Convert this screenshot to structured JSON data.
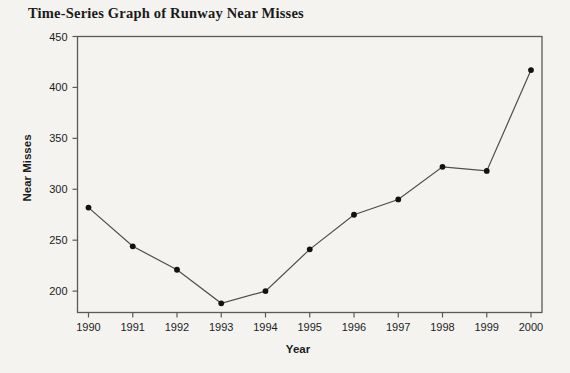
{
  "page": {
    "background": "#f4f3f0"
  },
  "chart_data": {
    "type": "line",
    "title": "Time-Series Graph of Runway Near Misses",
    "xlabel": "Year",
    "ylabel": "Near Misses",
    "x": [
      1990,
      1991,
      1992,
      1993,
      1994,
      1995,
      1996,
      1997,
      1998,
      1999,
      2000
    ],
    "series": [
      {
        "name": "Runway Near Misses",
        "values": [
          282,
          244,
          221,
          188,
          200,
          241,
          275,
          290,
          322,
          318,
          417
        ]
      }
    ],
    "yticks": [
      200,
      250,
      300,
      350,
      400,
      450
    ],
    "ylim": [
      179,
      450
    ],
    "grid": false,
    "legend_position": "none",
    "marker": "filled-circle",
    "colors": {
      "line": "#4d4d4d",
      "marker": "#121212",
      "frame": "#5a5a5a",
      "text": "#1c1c1c"
    }
  }
}
